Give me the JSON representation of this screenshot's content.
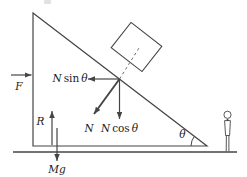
{
  "colors": {
    "line": "#454545",
    "dash": "#6e6e6e",
    "text": "#1b1b1b",
    "background": "#ffffff"
  },
  "labels": {
    "f": "F",
    "r": "R",
    "mg": "Mg",
    "n": "N",
    "theta": "θ",
    "n_sin": {
      "var": "N",
      "fn": "sin",
      "angle": "θ"
    },
    "n_cos": {
      "var": "N",
      "fn": "cos",
      "angle": "θ"
    }
  }
}
